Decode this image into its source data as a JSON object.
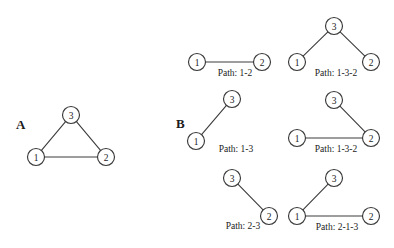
{
  "figure": {
    "width": 394,
    "height": 248,
    "background_color": "#ffffff",
    "node_stroke_color": "#3a3a3a",
    "edge_color": "#3c3c3c",
    "text_color": "#1c1c1c",
    "node_radius": 8.5
  },
  "panels": [
    {
      "label": "A",
      "label_x": 16,
      "label_y": 129,
      "graphs": [
        {
          "caption": "",
          "caption_x": 0,
          "caption_y": 0,
          "nodes": [
            {
              "id": "1",
              "x": 36,
              "y": 157
            },
            {
              "id": "2",
              "x": 106,
              "y": 157
            },
            {
              "id": "3",
              "x": 71,
              "y": 115
            }
          ],
          "edges": [
            {
              "from": "1",
              "to": "2"
            },
            {
              "from": "1",
              "to": "3"
            },
            {
              "from": "3",
              "to": "2"
            }
          ]
        }
      ]
    },
    {
      "label": "B",
      "label_x": 176,
      "label_y": 128,
      "graphs": [
        {
          "caption": "Path: 1-2",
          "caption_x": 235,
          "caption_y": 76,
          "nodes": [
            {
              "id": "1",
              "x": 197,
              "y": 62
            },
            {
              "id": "2",
              "x": 262,
              "y": 62
            }
          ],
          "edges": [
            {
              "from": "1",
              "to": "2"
            }
          ]
        },
        {
          "caption": "Path: 1-3-2",
          "caption_x": 336,
          "caption_y": 76,
          "nodes": [
            {
              "id": "3",
              "x": 334,
              "y": 26
            },
            {
              "id": "1",
              "x": 297,
              "y": 62
            },
            {
              "id": "2",
              "x": 371,
              "y": 62
            }
          ],
          "edges": [
            {
              "from": "3",
              "to": "1"
            },
            {
              "from": "3",
              "to": "2"
            }
          ]
        },
        {
          "caption": "Path: 1-3",
          "caption_x": 236,
          "caption_y": 152,
          "nodes": [
            {
              "id": "3",
              "x": 232,
              "y": 99
            },
            {
              "id": "1",
              "x": 196,
              "y": 141
            }
          ],
          "edges": [
            {
              "from": "1",
              "to": "3"
            }
          ]
        },
        {
          "caption": "Path: 1-3-2",
          "caption_x": 336,
          "caption_y": 152,
          "nodes": [
            {
              "id": "3",
              "x": 334,
              "y": 100
            },
            {
              "id": "1",
              "x": 297,
              "y": 138
            },
            {
              "id": "2",
              "x": 371,
              "y": 138
            }
          ],
          "edges": [
            {
              "from": "3",
              "to": "2"
            },
            {
              "from": "1",
              "to": "2"
            }
          ]
        },
        {
          "caption": "Path: 2-3",
          "caption_x": 243,
          "caption_y": 229,
          "nodes": [
            {
              "id": "3",
              "x": 232,
              "y": 178
            },
            {
              "id": "2",
              "x": 269,
              "y": 216
            }
          ],
          "edges": [
            {
              "from": "3",
              "to": "2"
            }
          ]
        },
        {
          "caption": "Path: 2-1-3",
          "caption_x": 337,
          "caption_y": 230,
          "nodes": [
            {
              "id": "3",
              "x": 334,
              "y": 178
            },
            {
              "id": "1",
              "x": 297,
              "y": 216
            },
            {
              "id": "2",
              "x": 371,
              "y": 216
            }
          ],
          "edges": [
            {
              "from": "3",
              "to": "1"
            },
            {
              "from": "1",
              "to": "2"
            }
          ]
        }
      ]
    }
  ]
}
